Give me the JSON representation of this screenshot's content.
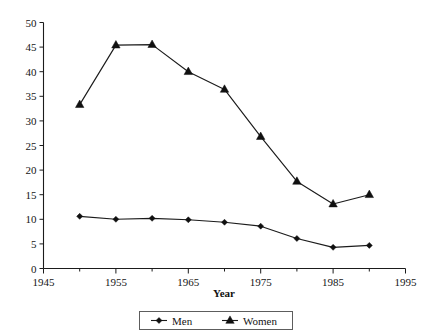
{
  "chart_data": {
    "type": "line",
    "title": "",
    "subtitle": "",
    "xlabel": "Year",
    "ylabel": "",
    "x": [
      1950,
      1955,
      1960,
      1965,
      1970,
      1975,
      1980,
      1985,
      1990
    ],
    "xlim": [
      1945,
      1995
    ],
    "ylim": [
      0,
      50
    ],
    "xticks": [
      1945,
      1955,
      1965,
      1975,
      1985,
      1995
    ],
    "xticks_minor": [
      1950,
      1960,
      1970,
      1980,
      1990
    ],
    "yticks": [
      0,
      5,
      10,
      15,
      20,
      25,
      30,
      35,
      40,
      45,
      50
    ],
    "grid": false,
    "legend_position": "bottom-center",
    "series": [
      {
        "name": "Men",
        "marker": "diamond",
        "color": "#101010",
        "values": [
          10.6,
          10.0,
          10.2,
          9.9,
          9.4,
          8.6,
          6.1,
          4.3,
          4.7
        ]
      },
      {
        "name": "Women",
        "marker": "triangle",
        "color": "#101010",
        "values": [
          33.3,
          45.4,
          45.5,
          40.0,
          36.4,
          26.8,
          17.7,
          13.1,
          15.0
        ]
      }
    ]
  },
  "axes": {
    "x_title": "Year",
    "x_tick_labels": [
      "1945",
      "1955",
      "1965",
      "1975",
      "1985",
      "1995"
    ],
    "y_tick_labels": [
      "0",
      "5",
      "10",
      "15",
      "20",
      "25",
      "30",
      "35",
      "40",
      "45",
      "50"
    ]
  },
  "legend": {
    "items": [
      {
        "label": "Men",
        "marker": "diamond-marker"
      },
      {
        "label": "Women",
        "marker": "triangle-marker"
      }
    ]
  }
}
